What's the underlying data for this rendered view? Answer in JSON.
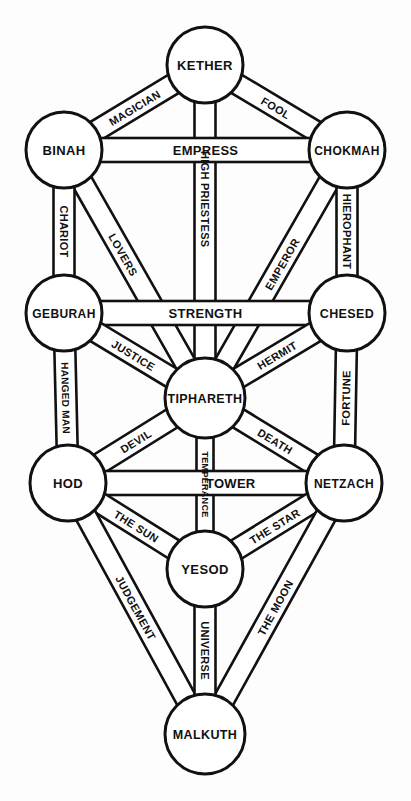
{
  "diagram": {
    "type": "kabbalistic-tree-of-life",
    "background_color": "#fdfdfd",
    "stroke_color": "#111111",
    "fill_color": "#ffffff",
    "width": 411,
    "height": 801
  },
  "sephiroth": [
    {
      "id": "kether",
      "label": "KETHER",
      "cx": 205,
      "cy": 65,
      "r": 38,
      "font_size": 13
    },
    {
      "id": "binah",
      "label": "BINAH",
      "cx": 64,
      "cy": 150,
      "r": 38,
      "font_size": 13
    },
    {
      "id": "chokmah",
      "label": "CHOKMAH",
      "cx": 347,
      "cy": 150,
      "r": 38,
      "font_size": 12
    },
    {
      "id": "geburah",
      "label": "GEBURAH",
      "cx": 64,
      "cy": 313,
      "r": 38,
      "font_size": 12
    },
    {
      "id": "chesed",
      "label": "CHESED",
      "cx": 347,
      "cy": 313,
      "r": 38,
      "font_size": 12.5
    },
    {
      "id": "tiphareth",
      "label": "TIPHARETH",
      "cx": 205,
      "cy": 398,
      "r": 40,
      "font_size": 12.5
    },
    {
      "id": "hod",
      "label": "HOD",
      "cx": 68,
      "cy": 483,
      "r": 38,
      "font_size": 13
    },
    {
      "id": "netzach",
      "label": "NETZACH",
      "cx": 344,
      "cy": 483,
      "r": 38,
      "font_size": 12
    },
    {
      "id": "yesod",
      "label": "YESOD",
      "cx": 205,
      "cy": 569,
      "r": 38,
      "font_size": 13
    },
    {
      "id": "malkuth",
      "label": "MALKUTH",
      "cx": 205,
      "cy": 734,
      "r": 40,
      "font_size": 12.5
    }
  ],
  "paths": [
    {
      "id": "fool",
      "label": "FOOL",
      "from": "kether",
      "to": "chokmah",
      "ribbon": true,
      "band": 21,
      "font_size": 11,
      "label_pos": 0.5,
      "flip": false
    },
    {
      "id": "magician",
      "label": "MAGICIAN",
      "from": "kether",
      "to": "binah",
      "ribbon": true,
      "band": 21,
      "font_size": 11,
      "label_pos": 0.5,
      "flip": true
    },
    {
      "id": "high-priestess",
      "label": "HIGH PRIESTESS",
      "from": "kether",
      "to": "tiphareth",
      "ribbon": true,
      "band": 21,
      "font_size": 11,
      "label_pos": 0.38,
      "flip": false
    },
    {
      "id": "empress",
      "label": "EMPRESS",
      "from": "binah",
      "to": "chokmah",
      "ribbon": true,
      "band": 24,
      "font_size": 13,
      "label_pos": 0.5,
      "flip": false
    },
    {
      "id": "emperor",
      "label": "EMPEROR",
      "from": "chokmah",
      "to": "tiphareth",
      "ribbon": true,
      "band": 21,
      "font_size": 11,
      "label_pos": 0.45,
      "flip": true
    },
    {
      "id": "hierophant",
      "label": "HIEROPHANT",
      "from": "chokmah",
      "to": "chesed",
      "ribbon": true,
      "band": 21,
      "font_size": 11,
      "label_pos": 0.5,
      "flip": false
    },
    {
      "id": "lovers",
      "label": "LOVERS",
      "from": "binah",
      "to": "tiphareth",
      "ribbon": true,
      "band": 21,
      "font_size": 11,
      "label_pos": 0.4,
      "flip": false
    },
    {
      "id": "chariot",
      "label": "CHARIOT",
      "from": "binah",
      "to": "geburah",
      "ribbon": true,
      "band": 21,
      "font_size": 11,
      "label_pos": 0.5,
      "flip": true
    },
    {
      "id": "strength",
      "label": "STRENGTH",
      "from": "geburah",
      "to": "chesed",
      "ribbon": true,
      "band": 24,
      "font_size": 13,
      "label_pos": 0.5,
      "flip": false
    },
    {
      "id": "hermit",
      "label": "HERMIT",
      "from": "chesed",
      "to": "tiphareth",
      "ribbon": true,
      "band": 21,
      "font_size": 11,
      "label_pos": 0.5,
      "flip": true
    },
    {
      "id": "fortune",
      "label": "FORTUNE",
      "from": "chesed",
      "to": "netzach",
      "ribbon": true,
      "band": 21,
      "font_size": 11,
      "label_pos": 0.5,
      "flip": false
    },
    {
      "id": "justice",
      "label": "JUSTICE",
      "from": "geburah",
      "to": "tiphareth",
      "ribbon": true,
      "band": 21,
      "font_size": 11,
      "label_pos": 0.5,
      "flip": false
    },
    {
      "id": "hanged-man",
      "label": "HANGED MAN",
      "from": "geburah",
      "to": "hod",
      "ribbon": true,
      "band": 21,
      "font_size": 10,
      "label_pos": 0.5,
      "flip": true
    },
    {
      "id": "death",
      "label": "DEATH",
      "from": "tiphareth",
      "to": "netzach",
      "ribbon": true,
      "band": 21,
      "font_size": 11,
      "label_pos": 0.5,
      "flip": false
    },
    {
      "id": "temperance",
      "label": "TEMPERANCE",
      "from": "tiphareth",
      "to": "yesod",
      "ribbon": true,
      "band": 17,
      "font_size": 9,
      "label_pos": 0.5,
      "flip": false
    },
    {
      "id": "devil",
      "label": "DEVIL",
      "from": "tiphareth",
      "to": "hod",
      "ribbon": true,
      "band": 21,
      "font_size": 11,
      "label_pos": 0.5,
      "flip": true
    },
    {
      "id": "tower",
      "label": "TOWER",
      "from": "hod",
      "to": "netzach",
      "ribbon": true,
      "band": 24,
      "font_size": 13,
      "label_pos": 0.62,
      "flip": false
    },
    {
      "id": "the-star",
      "label": "THE STAR",
      "from": "netzach",
      "to": "yesod",
      "ribbon": true,
      "band": 21,
      "font_size": 11,
      "label_pos": 0.5,
      "flip": true
    },
    {
      "id": "the-moon",
      "label": "THE MOON",
      "from": "netzach",
      "to": "malkuth",
      "ribbon": true,
      "band": 21,
      "font_size": 11,
      "label_pos": 0.5,
      "flip": false
    },
    {
      "id": "the-sun",
      "label": "THE SUN",
      "from": "hod",
      "to": "yesod",
      "ribbon": true,
      "band": 21,
      "font_size": 11,
      "label_pos": 0.5,
      "flip": false
    },
    {
      "id": "judgement",
      "label": "JUDGEMENT",
      "from": "hod",
      "to": "malkuth",
      "ribbon": true,
      "band": 21,
      "font_size": 11,
      "label_pos": 0.5,
      "flip": true
    },
    {
      "id": "universe",
      "label": "UNIVERSE",
      "from": "yesod",
      "to": "malkuth",
      "ribbon": true,
      "band": 21,
      "font_size": 11,
      "label_pos": 0.5,
      "flip": false
    }
  ],
  "plain_connectors": [
    {
      "id": "binah-kether-edge",
      "from": "binah",
      "to": "kether"
    },
    {
      "id": "chokmah-kether-edge",
      "from": "chokmah",
      "to": "kether"
    },
    {
      "id": "binah-chesed-edge",
      "from": "binah",
      "to": "tiphareth"
    },
    {
      "id": "chokmah-geburah-edge",
      "from": "chokmah",
      "to": "tiphareth"
    }
  ]
}
